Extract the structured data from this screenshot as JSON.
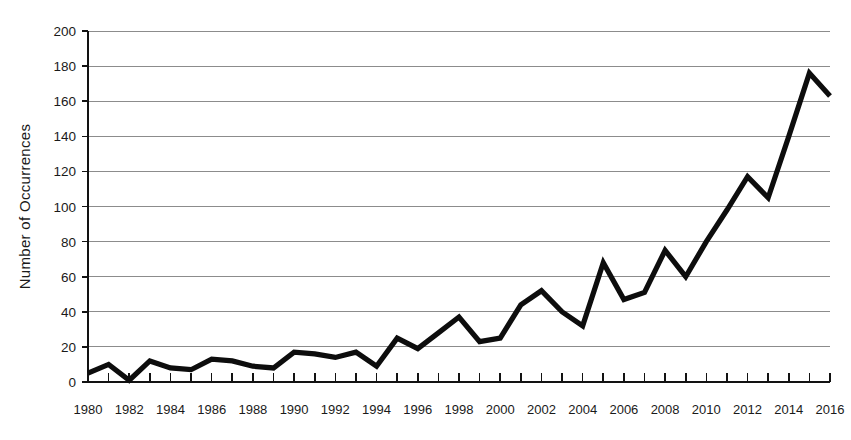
{
  "chart_data": {
    "type": "line",
    "title": "",
    "xlabel": "",
    "ylabel": "Number of Occurrences",
    "x": [
      1980,
      1981,
      1982,
      1983,
      1984,
      1985,
      1986,
      1987,
      1988,
      1989,
      1990,
      1991,
      1992,
      1993,
      1994,
      1995,
      1996,
      1997,
      1998,
      1999,
      2000,
      2001,
      2002,
      2003,
      2004,
      2005,
      2006,
      2007,
      2008,
      2009,
      2010,
      2011,
      2012,
      2013,
      2014,
      2015,
      2016
    ],
    "values": [
      5,
      10,
      1,
      12,
      8,
      7,
      13,
      12,
      9,
      8,
      17,
      16,
      14,
      17,
      9,
      25,
      19,
      28,
      37,
      23,
      25,
      44,
      52,
      40,
      32,
      68,
      47,
      51,
      75,
      60,
      80,
      98,
      117,
      105,
      140,
      176,
      163
    ],
    "series": [
      {
        "name": "Number of Occurrences",
        "values": [
          5,
          10,
          1,
          12,
          8,
          7,
          13,
          12,
          9,
          8,
          17,
          16,
          14,
          17,
          9,
          25,
          19,
          28,
          37,
          23,
          25,
          44,
          52,
          40,
          32,
          68,
          47,
          51,
          75,
          60,
          80,
          98,
          117,
          105,
          140,
          176,
          163
        ]
      }
    ],
    "xlim": [
      1980,
      2016
    ],
    "ylim": [
      0,
      200
    ],
    "y_ticks": [
      0,
      20,
      40,
      60,
      80,
      100,
      120,
      140,
      160,
      180,
      200
    ],
    "y_tick_labels": [
      "0",
      "20",
      "40",
      "60",
      "80",
      "100",
      "120",
      "140",
      "160",
      "180",
      "200"
    ],
    "x_ticks_minor_step": 1,
    "x_tick_labels": [
      "1980",
      "1982",
      "1984",
      "1986",
      "1988",
      "1990",
      "1992",
      "1994",
      "1996",
      "1998",
      "2000",
      "2002",
      "2004",
      "2006",
      "2008",
      "2010",
      "2012",
      "2014",
      "2016"
    ],
    "x_tick_label_values": [
      1980,
      1982,
      1984,
      1986,
      1988,
      1990,
      1992,
      1994,
      1996,
      1998,
      2000,
      2002,
      2004,
      2006,
      2008,
      2010,
      2012,
      2014,
      2016
    ],
    "grid": true,
    "grid_axis": "y",
    "legend": false,
    "legend_position": "none",
    "colors": {
      "line": "#0d0d0d",
      "grid": "#8c8c8c",
      "axis": "#121212",
      "text": "#1a1a1a",
      "background": "#ffffff"
    }
  }
}
